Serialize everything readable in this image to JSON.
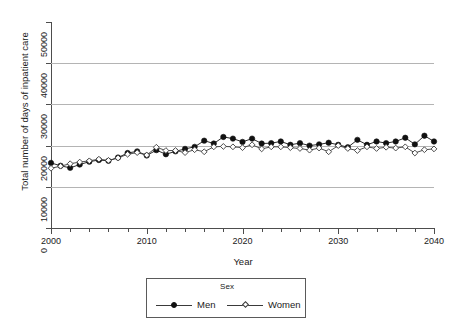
{
  "chart_data": {
    "type": "line",
    "title": "",
    "xlabel": "Year",
    "ylabel": "Total number of days of inpatient care",
    "xlim": [
      2000,
      2040
    ],
    "ylim": [
      0,
      50000
    ],
    "xticks": [
      2000,
      2010,
      2020,
      2030,
      2040
    ],
    "xtick_labels": [
      "2000",
      "2010",
      "2020",
      "2030",
      "2040"
    ],
    "yticks": [
      0,
      10000,
      20000,
      30000,
      40000,
      50000
    ],
    "ytick_labels": [
      "0",
      "10000",
      "20000",
      "30000",
      "40000",
      "50000"
    ],
    "grid": "horizontal",
    "gridlines": [
      10000,
      20000,
      30000,
      40000
    ],
    "legend": {
      "title": "Sex",
      "position": "bottom-center",
      "entries": [
        {
          "name": "Men",
          "marker": "filled-circle",
          "color": "#111111"
        },
        {
          "name": "Women",
          "marker": "open-diamond",
          "color": "#3a3a3a"
        }
      ]
    },
    "x": [
      2000,
      2001,
      2002,
      2003,
      2004,
      2005,
      2006,
      2007,
      2008,
      2009,
      2010,
      2011,
      2012,
      2013,
      2014,
      2015,
      2016,
      2017,
      2018,
      2019,
      2020,
      2021,
      2022,
      2023,
      2024,
      2025,
      2026,
      2027,
      2028,
      2029,
      2030,
      2031,
      2032,
      2033,
      2034,
      2035,
      2036,
      2037,
      2038,
      2039,
      2040
    ],
    "series": [
      {
        "name": "Men",
        "marker": "filled-circle",
        "color": "#111111",
        "values": [
          15800,
          15100,
          14600,
          15400,
          16100,
          16500,
          16300,
          17100,
          18200,
          18600,
          17600,
          18900,
          17900,
          18600,
          19200,
          19700,
          21200,
          20500,
          22100,
          21700,
          20900,
          21700,
          20500,
          20600,
          21000,
          20200,
          20600,
          20000,
          20300,
          20700,
          20200,
          19600,
          21400,
          20200,
          21000,
          20600,
          21000,
          21900,
          20300,
          22400,
          21000
        ]
      },
      {
        "name": "Women",
        "marker": "open-diamond",
        "color": "#3a3a3a",
        "values": [
          14500,
          15000,
          15600,
          16000,
          16300,
          16700,
          16400,
          17000,
          17900,
          18300,
          17700,
          19600,
          18800,
          18800,
          18300,
          19000,
          18500,
          19700,
          19800,
          19700,
          19500,
          20200,
          19200,
          19700,
          19700,
          19500,
          19300,
          18900,
          19400,
          18500,
          20000,
          19300,
          18800,
          19700,
          19300,
          19600,
          19400,
          19700,
          18200,
          19000,
          19200
        ]
      }
    ]
  }
}
